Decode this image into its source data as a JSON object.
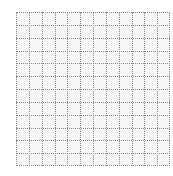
{
  "grid": {
    "columns": 12,
    "rows": 12,
    "line_style": "dotted",
    "line_color": "#8a8a8a",
    "cell_background": "#f6f6f6",
    "page_background": "#ffffff"
  }
}
